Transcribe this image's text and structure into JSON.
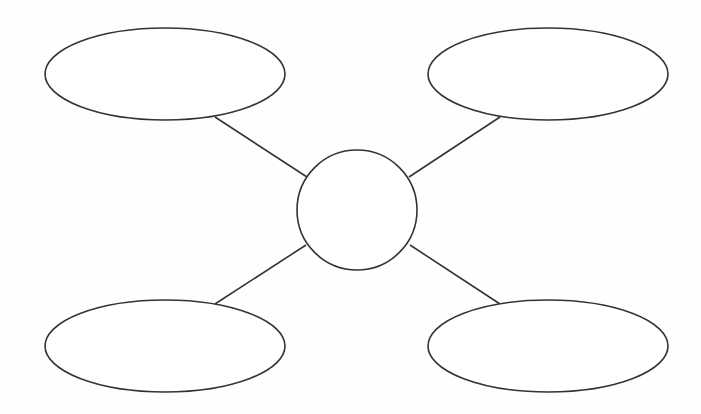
{
  "diagram": {
    "type": "spider-map",
    "title": "",
    "stroke_color": "#333333",
    "fill_color": "#ffffff",
    "background_color": "#fefefe",
    "center_node": {
      "id": "center",
      "shape": "circle",
      "label": ""
    },
    "nodes": [
      {
        "id": "top-left",
        "shape": "ellipse",
        "label": ""
      },
      {
        "id": "top-right",
        "shape": "ellipse",
        "label": ""
      },
      {
        "id": "bottom-left",
        "shape": "ellipse",
        "label": ""
      },
      {
        "id": "bottom-right",
        "shape": "ellipse",
        "label": ""
      }
    ],
    "connections": [
      {
        "from": "center",
        "to": "top-left"
      },
      {
        "from": "center",
        "to": "top-right"
      },
      {
        "from": "center",
        "to": "bottom-left"
      },
      {
        "from": "center",
        "to": "bottom-right"
      }
    ]
  }
}
